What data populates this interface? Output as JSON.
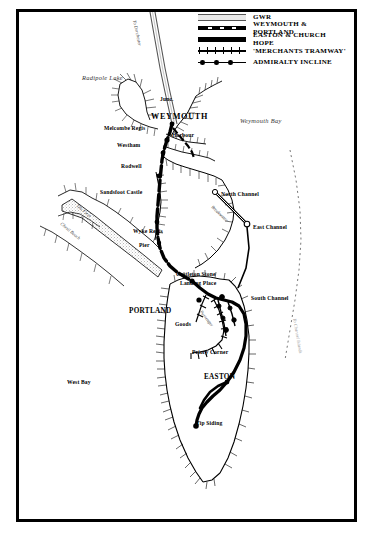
{
  "map": {
    "title": "Weymouth and Isle of Portland Railways",
    "frame_color": "#000000",
    "background": "#ffffff"
  },
  "legend": {
    "items": [
      {
        "symbol": "double-hairline",
        "label": "GWR"
      },
      {
        "symbol": "dashed-thick",
        "label": "WEYMOUTH & PORTLAND"
      },
      {
        "symbol": "solid-thick",
        "label": "EASTON & CHURCH HOPE"
      },
      {
        "symbol": "cross-hatched",
        "label": "'MERCHANTS TRAMWAY'"
      },
      {
        "symbol": "dotted-line",
        "label": "ADMIRALTY INCLINE"
      }
    ]
  },
  "labels": {
    "to_dorchester": "To Dorchester",
    "radipole_lake": "Radipole Lake",
    "junction": "Junc.",
    "weymouth": "WEYMOUTH",
    "weymouth_bay": "Weymouth Bay",
    "melcombe_regis": "Melcombe Regis",
    "harbour": "Harbour",
    "westham": "Westham",
    "rodwell": "Rodwell",
    "sandsfoot_castle": "Sandsfoot Castle",
    "north_channel": "North Channel",
    "breakwater": "Breakwater",
    "east_channel": "East Channel",
    "wyke_regis": "Wyke Regis",
    "pier": "Pier",
    "chesil_beach": "Chesil Beach",
    "fleet": "The Fleet",
    "castletown_stone": "Castleton Stone",
    "landing_place": "Landing Place",
    "south_channel": "South Channel",
    "portland": "PORTLAND",
    "goods": "Goods",
    "passenger": "Passenger",
    "priory_corner": "Priory Corner",
    "to_channel_islands": "To Channel Islands",
    "west_bay": "West Bay",
    "easton": "EASTON",
    "tip_siding": "Tip Siding"
  }
}
